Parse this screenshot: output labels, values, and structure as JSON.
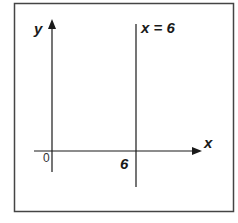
{
  "diagram": {
    "type": "coordinate-plane",
    "axes": {
      "x_label": "x",
      "y_label": "y",
      "origin_label": "0"
    },
    "lines": [
      {
        "equation_label": "x = 6",
        "orientation": "vertical",
        "x_value": 6
      }
    ],
    "tick_labels": {
      "x": [
        "6"
      ]
    },
    "colors": {
      "stroke": "#1a1a1a",
      "border": "#444444",
      "background": "#ffffff"
    }
  }
}
